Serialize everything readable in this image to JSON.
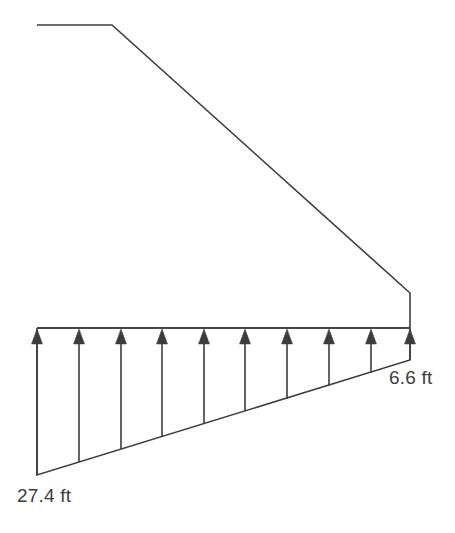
{
  "figure": {
    "background_color": "#ffffff",
    "line_color": "#3d3d3d",
    "text_color": "#3d3d3d",
    "line_width": 1.6
  },
  "labels": {
    "left_pressure": "27.4 ft",
    "right_pressure": "6.6 ft"
  },
  "chart_data": {
    "type": "area",
    "xlabel": "",
    "ylabel": "",
    "categories": [
      "heel (left)",
      "toe (right)"
    ],
    "values": [
      27.4,
      6.6
    ],
    "units": "ft",
    "annotations": [
      "27.4 ft",
      "6.6 ft"
    ],
    "arrow_count": 10,
    "arrow_direction": "up",
    "grid": false,
    "legend": "none"
  },
  "geometry": {
    "body_outline": "37,25 112,25 410,293 410,328 37,328",
    "base_line": {
      "x1": 37,
      "y1": 328,
      "x2": 410,
      "y2": 328
    },
    "pressure_outline": "37,328 37,475 410,360 410,328",
    "pressure_slope": {
      "x1": 37,
      "y1": 475,
      "x2": 410,
      "y2": 360
    },
    "left_pressure_edge": {
      "x1": 37,
      "y1": 328,
      "x2": 37,
      "y2": 475
    },
    "right_pressure_edge": {
      "x1": 410,
      "y1": 328,
      "x2": 410,
      "y2": 360
    },
    "arrows": [
      {
        "x": 37,
        "tail_y": 475
      },
      {
        "x": 79,
        "tail_y": 462
      },
      {
        "x": 121,
        "tail_y": 449
      },
      {
        "x": 162,
        "tail_y": 437
      },
      {
        "x": 204,
        "tail_y": 424
      },
      {
        "x": 245,
        "tail_y": 411
      },
      {
        "x": 287,
        "tail_y": 399
      },
      {
        "x": 329,
        "tail_y": 386
      },
      {
        "x": 371,
        "tail_y": 373
      },
      {
        "x": 410,
        "tail_y": 360
      }
    ],
    "arrow_head_tip_y": 329,
    "arrow_head_base_y": 344,
    "arrow_head_half_width": 5.5,
    "label_left_pos": {
      "x": 17,
      "y": 502
    },
    "label_right_pos": {
      "x": 389,
      "y": 384
    }
  }
}
